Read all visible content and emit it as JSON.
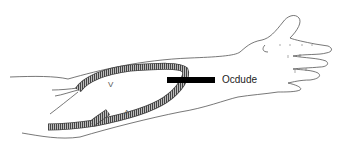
{
  "diagram": {
    "annotation": {
      "text": "Ocdude",
      "pointer": "black-bar"
    },
    "flow_markers": {
      "upper_limb": "V",
      "lower_limb": "Λ"
    },
    "colors": {
      "outline": "#555555",
      "graft_fill": "#9a9a9a",
      "graft_hatch": "#444444",
      "bar": "#000000",
      "background": "#ffffff"
    }
  }
}
